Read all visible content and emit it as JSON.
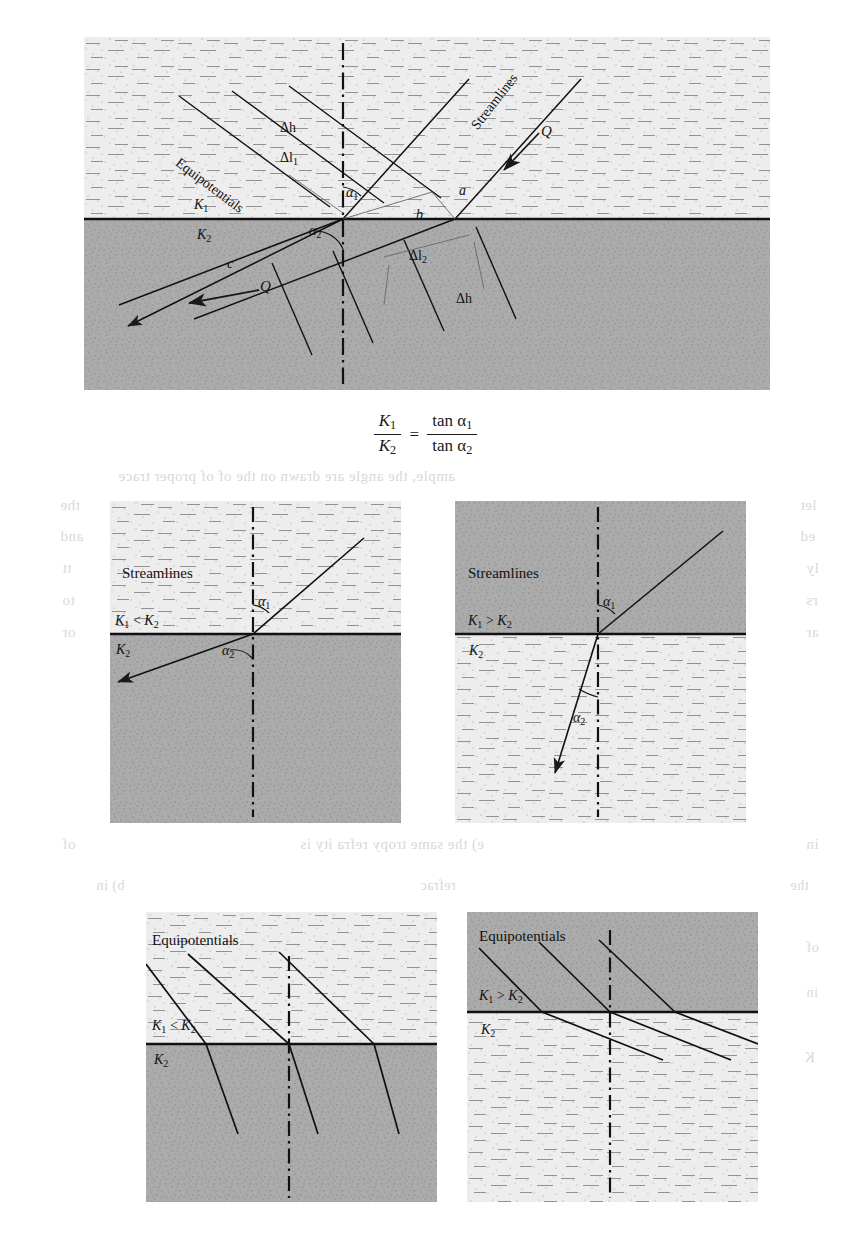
{
  "figure": {
    "type": "diagram",
    "formula": {
      "numerator_left": "K",
      "numerator_left_sub": "1",
      "denominator_left": "K",
      "denominator_left_sub": "2",
      "equals": "=",
      "numerator_right": "tan α",
      "numerator_right_sub": "1",
      "denominator_right": "tan α",
      "denominator_right_sub": "2",
      "plain": "K₁/K₂ = tan α₁ / tan α₂"
    }
  },
  "main_panel": {
    "name": "main-refraction-diagram",
    "upper_layer_label": "K",
    "upper_layer_sub": "1",
    "lower_layer_label": "K",
    "lower_layer_sub": "2",
    "upper_layer_shade": "light",
    "lower_layer_shade": "dark",
    "labels": {
      "streamlines": "Streamlines",
      "equipotentials": "Equipotentials",
      "flow_upper": "Q",
      "flow_lower": "Q",
      "angle1": "α",
      "angle1_sub": "1",
      "angle2": "α",
      "angle2_sub": "2",
      "delta_h_upper": "Δh",
      "delta_h_lower": "Δh",
      "delta_l1": "Δl",
      "delta_l1_sub": "1",
      "delta_l2": "Δl",
      "delta_l2_sub": "2",
      "seg_a": "a",
      "seg_b": "b",
      "seg_c": "c"
    }
  },
  "sub_panels": [
    {
      "id": "streamlines-k1-lt-k2",
      "title": "Streamlines",
      "condition": "K",
      "condition_sub1": "1",
      "condition_op": " < ",
      "condition_k2": "K",
      "condition_sub2": "2",
      "lower_label": "K",
      "lower_label_sub": "2",
      "angle1": "α",
      "angle1_sub": "1",
      "angle2": "α",
      "angle2_sub": "2",
      "upper_shade": "light",
      "lower_shade": "dark",
      "note": "streamline bends away from normal into lower layer"
    },
    {
      "id": "streamlines-k1-gt-k2",
      "title": "Streamlines",
      "condition": "K",
      "condition_sub1": "1",
      "condition_op": " > ",
      "condition_k2": "K",
      "condition_sub2": "2",
      "lower_label": "K",
      "lower_label_sub": "2",
      "angle1": "α",
      "angle1_sub": "1",
      "angle2": "α",
      "angle2_sub": "2",
      "upper_shade": "dark",
      "lower_shade": "light",
      "note": "streamline bends toward normal into lower layer"
    },
    {
      "id": "equipotentials-k1-lt-k2",
      "title": "Equipotentials",
      "condition": "K",
      "condition_sub1": "1",
      "condition_op": " < ",
      "condition_k2": "K",
      "condition_sub2": "2",
      "lower_label": "K",
      "lower_label_sub": "2",
      "upper_shade": "light",
      "lower_shade": "dark",
      "note": "equipotentials steepen into lower layer"
    },
    {
      "id": "equipotentials-k1-gt-k2",
      "title": "Equipotentials",
      "condition": "K",
      "condition_sub1": "1",
      "condition_op": " > ",
      "condition_k2": "K",
      "condition_sub2": "2",
      "lower_label": "K",
      "lower_label_sub": "2",
      "upper_shade": "dark",
      "lower_shade": "light",
      "note": "equipotentials flatten into lower layer"
    }
  ],
  "bleed_through": [
    {
      "text": "ample, the angle are drawn on the of of proper trace",
      "x": 118,
      "y": 468,
      "size": 15
    },
    {
      "text": "the",
      "x": 60,
      "y": 497,
      "size": 15
    },
    {
      "text": "let",
      "x": 800,
      "y": 497,
      "size": 15
    },
    {
      "text": "and",
      "x": 60,
      "y": 528,
      "size": 15
    },
    {
      "text": "ed",
      "x": 800,
      "y": 528,
      "size": 15
    },
    {
      "text": "tt",
      "x": 62,
      "y": 560,
      "size": 15
    },
    {
      "text": "ly",
      "x": 806,
      "y": 560,
      "size": 15
    },
    {
      "text": "to",
      "x": 62,
      "y": 592,
      "size": 15
    },
    {
      "text": "rs",
      "x": 806,
      "y": 592,
      "size": 15
    },
    {
      "text": "or",
      "x": 62,
      "y": 624,
      "size": 15
    },
    {
      "text": "ar",
      "x": 806,
      "y": 624,
      "size": 15
    },
    {
      "text": "of",
      "x": 62,
      "y": 836,
      "size": 15
    },
    {
      "text": "e) the same tropy refra ity is",
      "x": 300,
      "y": 836,
      "size": 15
    },
    {
      "text": "in",
      "x": 806,
      "y": 836,
      "size": 15
    },
    {
      "text": "b) in",
      "x": 96,
      "y": 878,
      "size": 14
    },
    {
      "text": "refrac",
      "x": 420,
      "y": 878,
      "size": 14
    },
    {
      "text": "the",
      "x": 790,
      "y": 878,
      "size": 14
    },
    {
      "text": "of",
      "x": 806,
      "y": 940,
      "size": 14
    },
    {
      "text": "in",
      "x": 806,
      "y": 985,
      "size": 14
    },
    {
      "text": "K",
      "x": 804,
      "y": 1050,
      "size": 14
    }
  ],
  "colors": {
    "light_soil": "#ececec",
    "dark_soil": "#a9a9a9",
    "line": "#1a1a1a",
    "paper": "#ffffff",
    "ghost_text": "#b9b9b9"
  }
}
